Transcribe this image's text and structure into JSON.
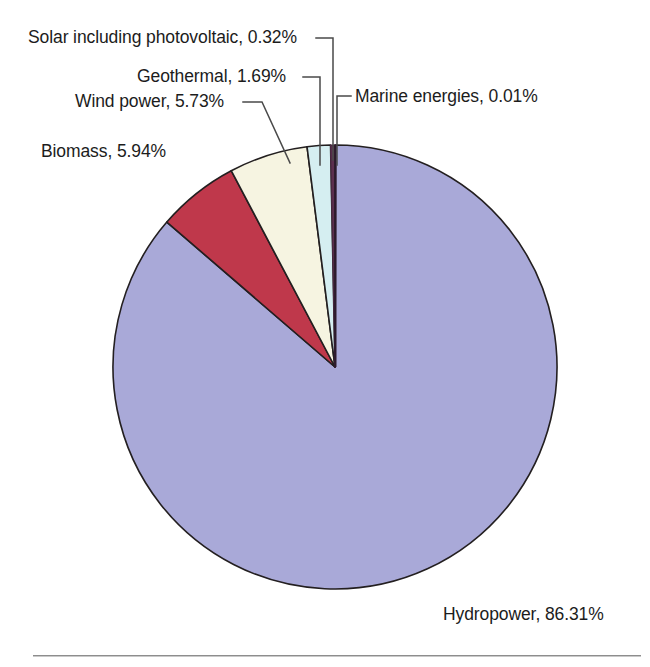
{
  "chart_data": {
    "type": "pie",
    "title": "",
    "subtitle": "",
    "xlabel": "",
    "ylabel": "",
    "legend_position": "none",
    "label_format": "{name}, {value}%",
    "unit": "%",
    "start_angle_deg": 0,
    "direction": "clockwise",
    "categories": [
      "Marine energies",
      "Hydropower",
      "Biomass",
      "Wind power",
      "Geothermal",
      "Solar including photovoltaic"
    ],
    "values": [
      0.01,
      86.31,
      5.94,
      5.73,
      1.69,
      0.32
    ],
    "colors": [
      "#5c2f4e",
      "#a9a9d8",
      "#bf384b",
      "#f6f4e1",
      "#d5eef1",
      "#5c2f4e"
    ],
    "slices": [
      {
        "name": "Marine energies",
        "value": 0.01,
        "label": "Marine energies, 0.01%",
        "color": "#5c2f4e"
      },
      {
        "name": "Hydropower",
        "value": 86.31,
        "label": "Hydropower, 86.31%",
        "color": "#a9a9d8"
      },
      {
        "name": "Biomass",
        "value": 5.94,
        "label": "Biomass, 5.94%",
        "color": "#bf384b"
      },
      {
        "name": "Wind power",
        "value": 5.73,
        "label": "Wind power, 5.73%",
        "color": "#f6f4e1"
      },
      {
        "name": "Geothermal",
        "value": 1.69,
        "label": "Geothermal, 1.69%",
        "color": "#d5eef1"
      },
      {
        "name": "Solar including photovoltaic",
        "value": 0.32,
        "label": "Solar including photovoltaic, 0.32%",
        "color": "#5c2f4e"
      }
    ]
  },
  "labels": {
    "solar": "Solar including photovoltaic, 0.32%",
    "geothermal": "Geothermal, 1.69%",
    "wind": "Wind power, 5.73%",
    "biomass": "Biomass, 5.94%",
    "marine": "Marine energies, 0.01%",
    "hydropower": "Hydropower, 86.31%"
  },
  "style": {
    "background": "#ffffff",
    "text_color": "#1c1c1c",
    "slice_outline": "#231f20",
    "rule_color": "#8d8d8d",
    "leader_color": "#4a4a4a"
  }
}
